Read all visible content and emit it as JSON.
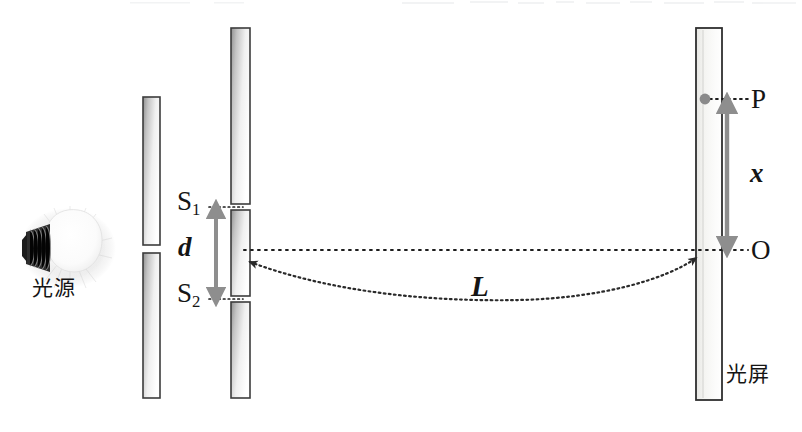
{
  "figure": {
    "background_color": "#ffffff",
    "width": 802,
    "height": 432
  },
  "labels": {
    "source": "光源",
    "screen": "光屏",
    "slit_top": "S",
    "slit_top_sub": "1",
    "slit_bottom": "S",
    "slit_bottom_sub": "2",
    "slit_separation": "d",
    "distance": "L",
    "fringe_position": "x",
    "point_bright": "P",
    "point_center": "O"
  },
  "colors": {
    "ink": "#151515",
    "plate_edge": "#3a3a3a",
    "plate_fill_dark": "#a8a8a8",
    "plate_fill_light": "#fdfdfd",
    "arrow_gray": "#8e8e8e",
    "dot_gray": "#8a8a8a",
    "bulb_base": "#2a2a2a",
    "bulb_glow": "#ffffff"
  },
  "elements": {
    "light_bulb": {
      "name": "光源",
      "cx": 62,
      "cy": 248
    },
    "single_slit_plate": {
      "x": 143,
      "width": 17,
      "segments": [
        {
          "y": 97,
          "height": 148
        },
        {
          "y": 253,
          "height": 145
        }
      ],
      "slit_center_y": 249
    },
    "double_slit_plate": {
      "x": 231,
      "width": 19,
      "segments": [
        {
          "y": 28,
          "height": 176
        },
        {
          "y": 210,
          "height": 86
        },
        {
          "y": 302,
          "height": 96
        }
      ],
      "slit_top_y": 207,
      "slit_bottom_y": 299
    },
    "observation_screen": {
      "x": 696,
      "y": 28,
      "width": 26,
      "height": 372
    },
    "optical_axis": {
      "y": 250,
      "x_from": 244,
      "x_to": 702
    },
    "bright_point": {
      "cx": 705,
      "cy": 99,
      "r": 5
    },
    "d_arrow": {
      "x": 216,
      "y_top": 207,
      "y_bottom": 299
    },
    "x_arrow": {
      "x": 727,
      "y_top": 100,
      "y_bottom": 250
    },
    "L_arc": {
      "x_from": 246,
      "x_to": 700,
      "y_from": 262,
      "y_to": 256,
      "sag": 300
    }
  }
}
